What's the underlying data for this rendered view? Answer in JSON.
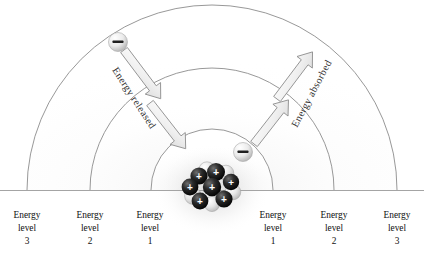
{
  "figure": {
    "background_color": "#ffffff",
    "arc_stroke_color": "#8c8c8c",
    "baseline_color": "#9a9a9a",
    "label_color": "#111111",
    "arrow_fill": "#f2f2f2",
    "arrow_stroke": "#8f8f8f",
    "proton_color": "#1a1a1a",
    "neutron_color": "#e8e8e8",
    "electron_color": "#ededed"
  },
  "labels": {
    "left": [
      {
        "line1": "Energy",
        "line2": "level",
        "line3": "3",
        "x": 27
      },
      {
        "line1": "Energy",
        "line2": "level",
        "line3": "2",
        "x": 90
      },
      {
        "line1": "Energy",
        "line2": "level",
        "line3": "1",
        "x": 150
      }
    ],
    "right": [
      {
        "line1": "Energy",
        "line2": "level",
        "line3": "1",
        "x": 273
      },
      {
        "line1": "Energy",
        "line2": "level",
        "line3": "2",
        "x": 334
      },
      {
        "line1": "Energy",
        "line2": "level",
        "line3": "3",
        "x": 397
      }
    ]
  },
  "annotations": {
    "released": {
      "text": "Energy released",
      "rotation": 57,
      "x": 118,
      "y": 72
    },
    "absorbed": {
      "text": "Energy absorbed",
      "rotation": -62,
      "x": 293,
      "y": 74
    }
  },
  "electrons": [
    {
      "name": "electron-outer-left",
      "cx": 118,
      "cy": 42,
      "r": 9.5,
      "charge": "–"
    },
    {
      "name": "electron-inner-right",
      "cx": 243,
      "cy": 152,
      "r": 9.5,
      "charge": "–"
    }
  ],
  "nucleus": {
    "center_x": 212,
    "center_y": 190,
    "protons": [
      {
        "cx": 199,
        "cy": 176,
        "r": 8.6,
        "charge": "+"
      },
      {
        "cx": 216,
        "cy": 172,
        "r": 9.0,
        "charge": "+"
      },
      {
        "cx": 190,
        "cy": 187,
        "r": 8.4,
        "charge": "+"
      },
      {
        "cx": 212,
        "cy": 187,
        "r": 9.2,
        "charge": "+"
      },
      {
        "cx": 231,
        "cy": 182,
        "r": 8.2,
        "charge": "+"
      },
      {
        "cx": 200,
        "cy": 201,
        "r": 8.4,
        "charge": "+"
      },
      {
        "cx": 224,
        "cy": 199,
        "r": 8.6,
        "charge": "+"
      }
    ],
    "neutrons": [
      {
        "cx": 207,
        "cy": 170,
        "r": 8.2
      },
      {
        "cx": 226,
        "cy": 173,
        "r": 7.8
      },
      {
        "cx": 193,
        "cy": 196,
        "r": 8.4
      },
      {
        "cx": 210,
        "cy": 196,
        "r": 8.0
      },
      {
        "cx": 233,
        "cy": 192,
        "r": 7.8
      },
      {
        "cx": 212,
        "cy": 204,
        "r": 7.6
      }
    ]
  },
  "orbits": [
    {
      "name": "orbit-level-3",
      "radius": 185,
      "apex_y": 16
    },
    {
      "name": "orbit-level-2",
      "radius": 122,
      "apex_y": 79
    },
    {
      "name": "orbit-level-1",
      "radius": 62,
      "apex_y": 139
    }
  ],
  "arrows": {
    "released": [
      {
        "x1": 124,
        "y1": 50,
        "x2": 161,
        "y2": 99
      },
      {
        "x1": 150,
        "y1": 103,
        "x2": 186,
        "y2": 149
      }
    ],
    "absorbed": [
      {
        "x1": 288,
        "y1": 143,
        "x2": 254,
        "y2": 99
      },
      {
        "x1": 310,
        "y1": 98,
        "x2": 277,
        "y2": 51
      }
    ]
  }
}
